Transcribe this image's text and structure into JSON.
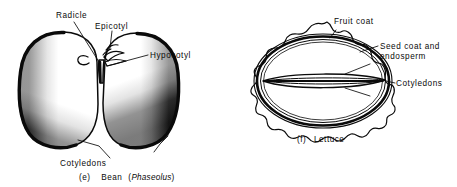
{
  "figure": {
    "background_color": "#ffffff",
    "ink_color": "#0a0a0a",
    "panels": [
      {
        "id": "bean",
        "caption_index": "(e)",
        "caption_name": "Bean",
        "caption_species": "Phaseolus",
        "caption_full": "(e)   Bean (Phaseolus)",
        "labels": [
          {
            "name": "radicle",
            "text": "Radicle"
          },
          {
            "name": "epicotyl",
            "text": "Epicotyl"
          },
          {
            "name": "hypocotyl",
            "text": "Hypocotyl"
          },
          {
            "name": "cotyledons",
            "text": "Cotyledons"
          }
        ]
      },
      {
        "id": "lettuce",
        "caption_index": "(f)",
        "caption_name": "Lettuce",
        "caption_full": "(f)  Lettuce",
        "labels": [
          {
            "name": "fruit-coat",
            "text": "Fruit coat"
          },
          {
            "name": "seed-coat-line1",
            "text": "Seed coat and"
          },
          {
            "name": "seed-coat-line2",
            "text": "endosperm"
          },
          {
            "name": "cotyledons",
            "text": "Cotyledons"
          }
        ]
      }
    ]
  }
}
